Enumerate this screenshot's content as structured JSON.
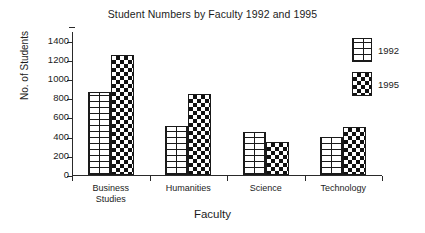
{
  "chart_data": {
    "type": "bar",
    "title": "Student Numbers by Faculty 1992 and 1995",
    "xlabel": "Faculty",
    "ylabel": "No. of Students",
    "categories": [
      "Business\nStudies",
      "Humanities",
      "Science",
      "Technology"
    ],
    "series": [
      {
        "name": "1992",
        "values": [
          865,
          510,
          445,
          395
        ],
        "pattern": "brick",
        "color": "#ffffff"
      },
      {
        "name": "1995",
        "values": [
          1255,
          840,
          345,
          500
        ],
        "pattern": "checkerboard",
        "color": "#111111"
      }
    ],
    "ylim": [
      0,
      1500
    ],
    "yticks": [
      0,
      200,
      400,
      600,
      800,
      1000,
      1200,
      1400
    ],
    "ytick_labels": [
      "0",
      "200",
      "400",
      "600",
      "800",
      "1000",
      "1200",
      "1400"
    ],
    "grid": false,
    "legend_position": "top-right",
    "legend_entries": [
      "1992",
      "1995"
    ],
    "axis_color": "#2a2a2a",
    "background": "#ffffff"
  },
  "axis": {
    "y_title": "No. of Students",
    "x_title": "Faculty"
  },
  "legend": {
    "items": [
      {
        "label": "1992",
        "swatch": "brick-swatch"
      },
      {
        "label": "1995",
        "swatch": "checkerboard-swatch"
      }
    ]
  }
}
